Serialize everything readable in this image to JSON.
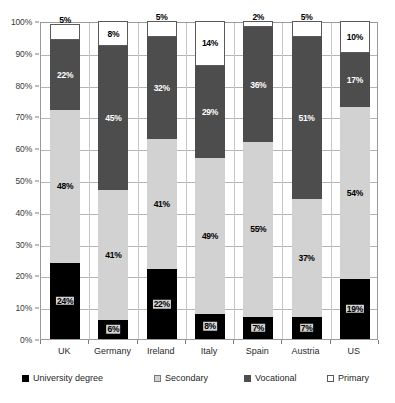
{
  "chart_data": {
    "type": "bar",
    "subtype": "stacked-bar-100",
    "title": "",
    "xlabel": "",
    "ylabel": "",
    "ylim": [
      0,
      100
    ],
    "grid": true,
    "legend_position": "bottom",
    "categories": [
      "UK",
      "Germany",
      "Ireland",
      "Italy",
      "Spain",
      "Austria",
      "US"
    ],
    "series": [
      {
        "name": "University degree",
        "color": "#000000",
        "values": [
          24,
          6,
          22,
          8,
          7,
          7,
          19
        ]
      },
      {
        "name": "Secondary",
        "color": "#d2d2d2",
        "values": [
          48,
          41,
          41,
          49,
          55,
          37,
          54
        ]
      },
      {
        "name": "Vocational",
        "color": "#4d4d4d",
        "values": [
          22,
          45,
          32,
          29,
          36,
          51,
          17
        ]
      },
      {
        "name": "Primary",
        "color": "#ffffff",
        "values": [
          5,
          8,
          5,
          14,
          2,
          5,
          10
        ]
      }
    ],
    "data_labels": {
      "UK": {
        "university": "24%",
        "secondary": "48%",
        "vocational": "22%",
        "primary": "5%"
      },
      "Germany": {
        "university": "6%",
        "secondary": "41%",
        "vocational": "45%",
        "primary": "8%"
      },
      "Ireland": {
        "university": "22%",
        "secondary": "41%",
        "vocational": "32%",
        "primary": "5%"
      },
      "Italy": {
        "university": "8%",
        "secondary": "49%",
        "vocational": "29%",
        "primary": "14%"
      },
      "Spain": {
        "university": "7%",
        "secondary": "55%",
        "vocational": "36%",
        "primary": "2%"
      },
      "Austria": {
        "university": "7%",
        "secondary": "37%",
        "vocational": "51%",
        "primary": "5%"
      },
      "US": {
        "university": "19%",
        "secondary": "54%",
        "vocational": "17%",
        "primary": "10%"
      }
    },
    "yticks": [
      "0%",
      "10%",
      "20%",
      "30%",
      "40%",
      "50%",
      "60%",
      "70%",
      "80%",
      "90%",
      "100%"
    ],
    "ytick_values": [
      0,
      10,
      20,
      30,
      40,
      50,
      60,
      70,
      80,
      90,
      100
    ]
  },
  "legend": {
    "items": [
      {
        "label": "University degree",
        "swatch": "university-swatch"
      },
      {
        "label": "Secondary",
        "swatch": "secondary-swatch"
      },
      {
        "label": "Vocational",
        "swatch": "vocational-swatch"
      },
      {
        "label": "Primary",
        "swatch": "primary-swatch"
      }
    ]
  }
}
